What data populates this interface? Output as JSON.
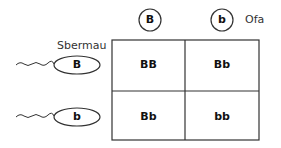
{
  "labels": {
    "egg_label": "Ofa",
    "sperm_label": "Sbermau"
  },
  "egg_alleles": [
    "B",
    "b"
  ],
  "sperm_alleles": [
    "B",
    "b"
  ],
  "grid": [
    [
      "BB",
      "Bb"
    ],
    [
      "Bb",
      "bb"
    ]
  ],
  "colors": {
    "line": "#333333",
    "text": "#111111",
    "background": "#ffffff"
  }
}
